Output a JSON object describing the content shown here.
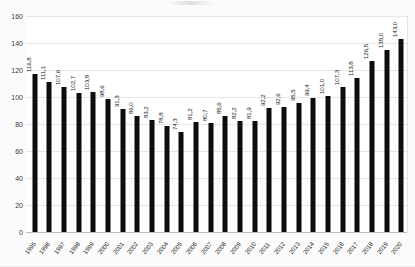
{
  "chart_data": {
    "type": "bar",
    "title": "",
    "xlabel": "",
    "ylabel": "",
    "ylim": [
      0,
      160
    ],
    "yticks": [
      0,
      20,
      40,
      60,
      80,
      100,
      120,
      140,
      160
    ],
    "grid": true,
    "legend": false,
    "decimal_separator": ",",
    "bar_color": "#0d0d0d",
    "background_color": "#fbfbfb",
    "plot_background_color": "#ffffff",
    "gridline_color": "#e6e6e6",
    "categories": [
      "1995",
      "1996",
      "1997",
      "1998",
      "1999",
      "2000",
      "2001",
      "2002",
      "2003",
      "2004",
      "2005",
      "2006",
      "2007",
      "2008",
      "2009",
      "2010",
      "2011",
      "2012",
      "2013",
      "2014",
      "2015",
      "2016",
      "2017",
      "2018",
      "2019",
      "2020"
    ],
    "values": [
      116.8,
      111.1,
      107.6,
      102.7,
      103.8,
      98.6,
      91.3,
      86.0,
      83.2,
      78.8,
      74.3,
      81.2,
      80.7,
      85.6,
      82.2,
      81.9,
      92.2,
      92.6,
      95.5,
      99.4,
      101.0,
      107.3,
      113.8,
      126.5,
      135.0,
      143.0
    ],
    "data_labels": [
      "116,8",
      "111,1",
      "107,6",
      "102,7",
      "103,8",
      "98,6",
      "91,3",
      "86,0",
      "83,2",
      "78,8",
      "74,3",
      "81,2",
      "80,7",
      "85,6",
      "82,2",
      "81,9",
      "92,2",
      "92,6",
      "95,5",
      "99,4",
      "101,0",
      "107,3",
      "113,8",
      "126,5",
      "135,0",
      "143,0"
    ],
    "ytick_labels": [
      "0",
      "20",
      "40",
      "60",
      "80",
      "100",
      "120",
      "140",
      "160"
    ]
  }
}
